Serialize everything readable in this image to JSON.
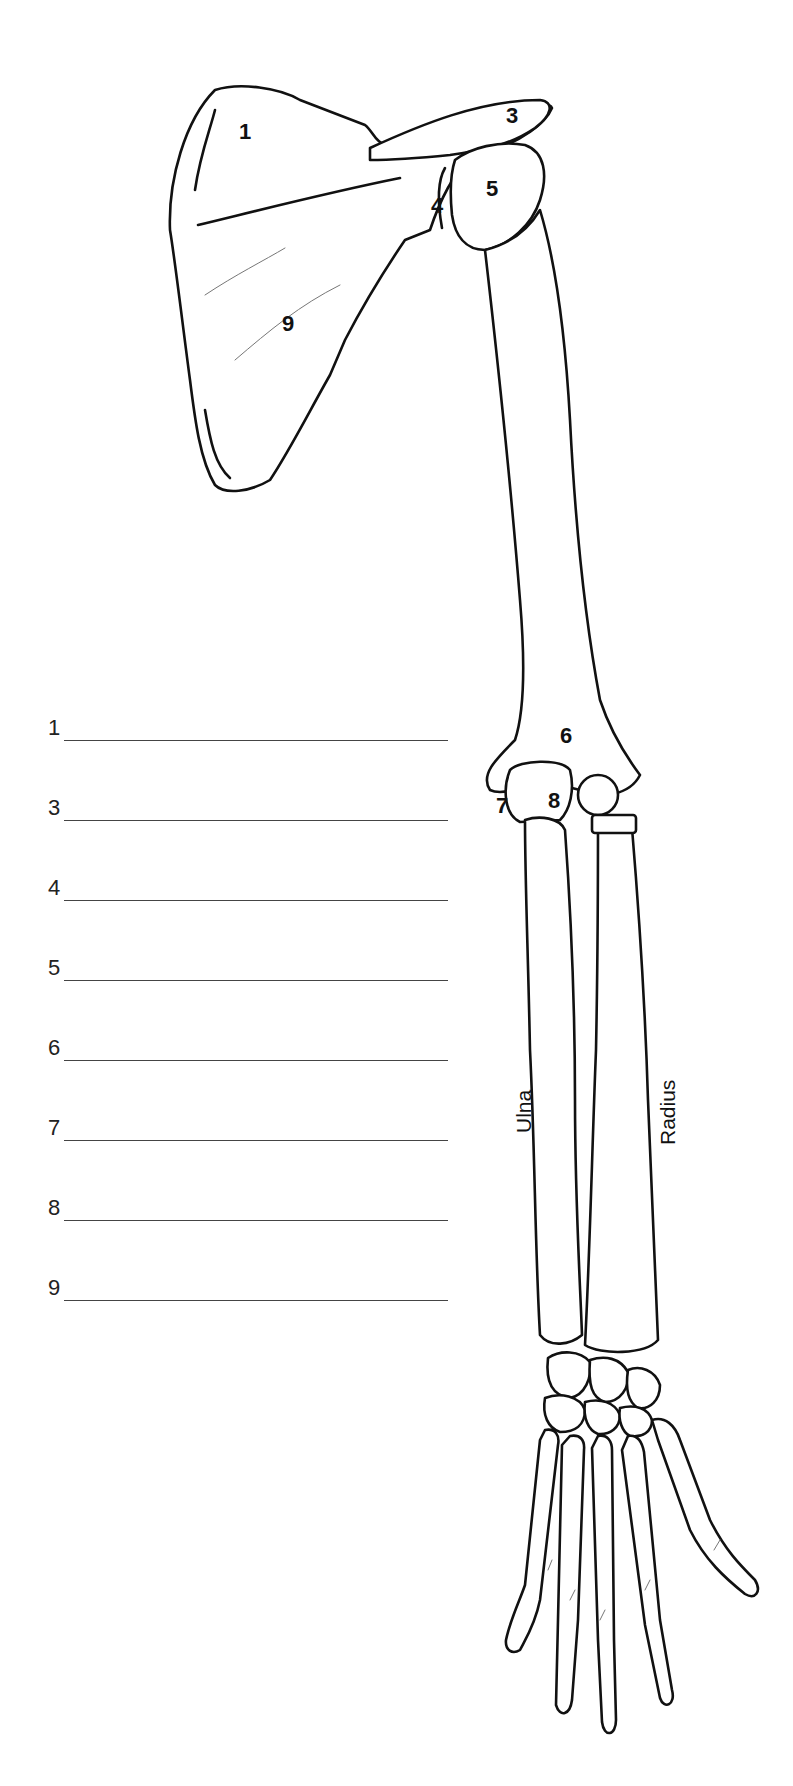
{
  "worksheet": {
    "blanks": [
      {
        "number": "1",
        "answer": ""
      },
      {
        "number": "3",
        "answer": ""
      },
      {
        "number": "4",
        "answer": ""
      },
      {
        "number": "5",
        "answer": ""
      },
      {
        "number": "6",
        "answer": ""
      },
      {
        "number": "7",
        "answer": ""
      },
      {
        "number": "8",
        "answer": ""
      },
      {
        "number": "9",
        "answer": ""
      }
    ]
  },
  "diagram": {
    "number_labels": [
      "1",
      "3",
      "4",
      "5",
      "6",
      "7",
      "8",
      "9"
    ],
    "bone_labels": {
      "ulna": "Ulna",
      "radius": "Radius"
    },
    "line_color": "#111111",
    "blank_line_color": "#444444"
  }
}
